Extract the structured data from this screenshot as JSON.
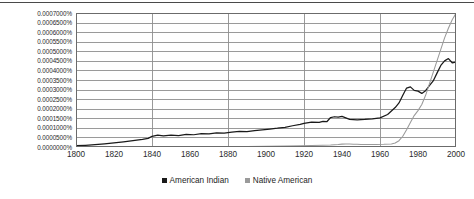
{
  "chart_data": {
    "type": "line",
    "title": "",
    "xlabel": "",
    "ylabel": "",
    "xlim": [
      1800,
      2000
    ],
    "ylim": [
      0.0,
      0.0007
    ],
    "grid": "horizontal-major-and-vertical-every-40-years",
    "legend_position": "bottom-center",
    "y_tick_labels": [
      "0.0007000%",
      "0.0006500%",
      "0.0006000%",
      "0.0005500%",
      "0.0005000%",
      "0.0004500%",
      "0.0004000%",
      "0.0003500%",
      "0.0003000%",
      "0.0002500%",
      "0.0002000%",
      "0.0001500%",
      "0.0001000%",
      "0.0000500%",
      "0.0000000%"
    ],
    "y_tick_values": [
      0.0007,
      0.00065,
      0.0006,
      0.00055,
      0.0005,
      0.00045,
      0.0004,
      0.00035,
      0.0003,
      0.00025,
      0.0002,
      0.00015,
      0.0001,
      5e-05,
      0.0
    ],
    "x_tick_labels": [
      "1800",
      "1820",
      "1840",
      "1860",
      "1880",
      "1900",
      "1920",
      "1940",
      "1960",
      "1980",
      "2000"
    ],
    "x_tick_values": [
      1800,
      1820,
      1840,
      1860,
      1880,
      1900,
      1920,
      1940,
      1960,
      1980,
      2000
    ],
    "x_gridline_values": [
      1840,
      1880,
      1920,
      1960
    ],
    "series": [
      {
        "name": "American Indian",
        "color": "#1a1a1a",
        "x": [
          1800,
          1805,
          1810,
          1815,
          1820,
          1825,
          1830,
          1835,
          1838,
          1840,
          1843,
          1846,
          1850,
          1854,
          1858,
          1862,
          1866,
          1870,
          1874,
          1878,
          1882,
          1886,
          1890,
          1894,
          1898,
          1902,
          1906,
          1910,
          1914,
          1918,
          1920,
          1924,
          1928,
          1930,
          1932,
          1934,
          1936,
          1938,
          1940,
          1944,
          1948,
          1952,
          1956,
          1960,
          1964,
          1968,
          1970,
          1972,
          1974,
          1976,
          1978,
          1980,
          1982,
          1984,
          1986,
          1988,
          1990,
          1992,
          1994,
          1996,
          1998,
          2000
        ],
        "y": [
          7e-06,
          9e-06,
          1.2e-05,
          1.6e-05,
          2.1e-05,
          2.7e-05,
          3.3e-05,
          4e-05,
          4.5e-05,
          5.6e-05,
          6.2e-05,
          5.8e-05,
          6.2e-05,
          6e-05,
          6.6e-05,
          6.4e-05,
          7e-05,
          6.8e-05,
          7.4e-05,
          7.2e-05,
          7.8e-05,
          8.2e-05,
          8e-05,
          8.6e-05,
          9e-05,
          9.4e-05,
          9.8e-05,
          0.000103,
          0.000111,
          0.000118,
          0.000123,
          0.00013,
          0.000129,
          0.000134,
          0.000132,
          0.000154,
          0.000158,
          0.000156,
          0.00016,
          0.000144,
          0.000142,
          0.000144,
          0.000147,
          0.000152,
          0.00017,
          0.000206,
          0.00023,
          0.00027,
          0.000308,
          0.000314,
          0.000296,
          0.000292,
          0.00028,
          0.000294,
          0.00032,
          0.000345,
          0.000386,
          0.000426,
          0.00045,
          0.000462,
          0.00044,
          0.000444
        ]
      },
      {
        "name": "Native American",
        "color": "#9a9a9a",
        "x": [
          1800,
          1820,
          1840,
          1860,
          1880,
          1890,
          1900,
          1910,
          1918,
          1924,
          1930,
          1934,
          1938,
          1940,
          1942,
          1944,
          1946,
          1948,
          1950,
          1954,
          1958,
          1962,
          1966,
          1968,
          1970,
          1972,
          1974,
          1976,
          1978,
          1980,
          1982,
          1984,
          1986,
          1988,
          1990,
          1992,
          1994,
          1996,
          1998,
          2000
        ],
        "y": [
          1e-06,
          1.2e-06,
          1.5e-06,
          1.8e-06,
          2.2e-06,
          2.8e-06,
          3.5e-06,
          4.5e-06,
          6e-06,
          7.5e-06,
          9e-06,
          1.05e-05,
          1.3e-05,
          1.5e-05,
          1.6e-05,
          1.55e-05,
          1.45e-05,
          1.4e-05,
          1.35e-05,
          1.3e-05,
          1.35e-05,
          1.4e-05,
          1.6e-05,
          2.1e-05,
          3.3e-05,
          5.6e-05,
          9e-05,
          0.000128,
          0.000164,
          0.00019,
          0.000222,
          0.00027,
          0.00033,
          0.00039,
          0.00045,
          0.00051,
          0.00057,
          0.00062,
          0.000665,
          0.000698
        ]
      }
    ]
  },
  "legend": {
    "items": [
      {
        "label": "American Indian",
        "color": "#1a1a1a"
      },
      {
        "label": "Native American",
        "color": "#9a9a9a"
      }
    ]
  }
}
